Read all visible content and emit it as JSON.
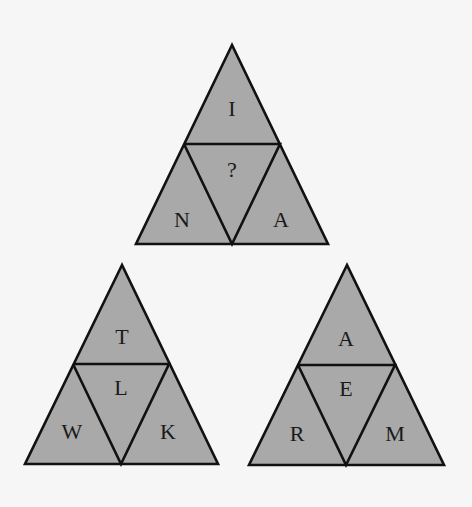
{
  "puzzle": {
    "type": "letter-triangle-puzzle",
    "triangles": [
      {
        "id": "top",
        "top": "I",
        "center": "?",
        "left": "N",
        "right": "A"
      },
      {
        "id": "bottom-left",
        "top": "T",
        "center": "L",
        "left": "W",
        "right": "K"
      },
      {
        "id": "bottom-right",
        "top": "A",
        "center": "E",
        "left": "R",
        "right": "M"
      }
    ]
  },
  "colors": {
    "background": "#f6f6f6",
    "fill": "#a9a9a9",
    "stroke": "#111111",
    "text": "#1a1a1a"
  }
}
